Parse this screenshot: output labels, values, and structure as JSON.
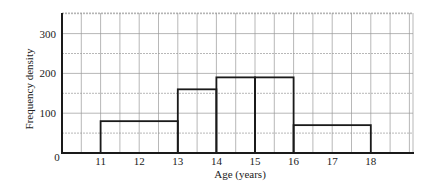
{
  "chart_data": {
    "type": "bar",
    "subtype": "histogram",
    "title": "",
    "xlabel": "Age (years)",
    "ylabel": "Frequency density",
    "xlim": [
      10,
      19
    ],
    "ylim": [
      0,
      350
    ],
    "grid": true,
    "x_ticks": [
      "0",
      "11",
      "12",
      "13",
      "14",
      "15",
      "16",
      "17",
      "18"
    ],
    "y_ticks": [
      "0",
      "100",
      "200",
      "300"
    ],
    "bins": [
      {
        "from": 11,
        "to": 13,
        "value": 80
      },
      {
        "from": 13,
        "to": 14,
        "value": 160
      },
      {
        "from": 14,
        "to": 15,
        "value": 190
      },
      {
        "from": 15,
        "to": 16,
        "value": 190
      },
      {
        "from": 16,
        "to": 18,
        "value": 70
      }
    ],
    "categories": [
      "11-13",
      "13-14",
      "14-15",
      "15-16",
      "16-18"
    ],
    "values": [
      80,
      160,
      190,
      190,
      70
    ]
  },
  "colors": {
    "bar_stroke": "#1a1a1a",
    "grid": "#9a9a9a",
    "axis": "#1a1a1a"
  }
}
